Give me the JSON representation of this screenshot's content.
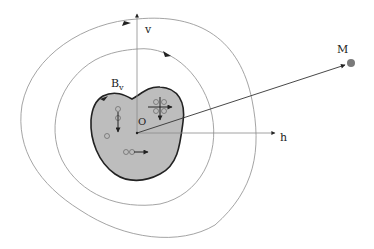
{
  "figure": {
    "labels": {
      "v_axis": "v",
      "h_axis": "h",
      "origin": "O",
      "point": "M",
      "body": "B",
      "body_sub": "v"
    },
    "colors": {
      "body_fill": "#bdbdbd",
      "body_stroke": "#222222",
      "curve": "#9a9a9a",
      "axis": "#8a8a8a",
      "arrow": "#222222",
      "point_fill": "#7a7a7a"
    },
    "elements": [
      "body B_v (shaded region)",
      "inner closed field line",
      "outer closed field line",
      "v axis",
      "h axis",
      "vector O to M",
      "dipole pairs with arrows inside body"
    ]
  }
}
